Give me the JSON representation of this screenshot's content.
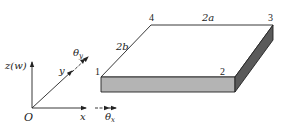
{
  "diagram": {
    "plate": {
      "corners": [
        {
          "id": "1",
          "label": "1"
        },
        {
          "id": "2",
          "label": "2"
        },
        {
          "id": "3",
          "label": "3"
        },
        {
          "id": "4",
          "label": "4"
        }
      ],
      "edge_labels": {
        "length": "2a",
        "width": "2b"
      },
      "colors": {
        "top": "#ffffff",
        "front": "#b4b4b4",
        "side": "#5a5a5a",
        "edge": "#222222"
      }
    },
    "axes": {
      "origin": "O",
      "x": "x",
      "y": "y",
      "z": "z(w)",
      "theta_x": {
        "symbol": "θ",
        "sub": "x"
      },
      "theta_y": {
        "symbol": "θ",
        "sub": "y"
      }
    }
  }
}
